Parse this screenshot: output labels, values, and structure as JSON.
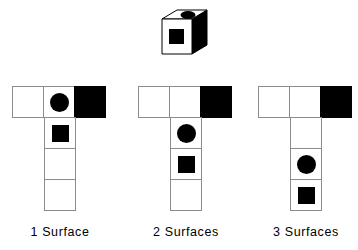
{
  "figure": {
    "background_color": "#ffffff",
    "ink_color": "#000000",
    "grid_line_color": "#8b8b8b"
  },
  "cube": {
    "name": "reference-cube",
    "description": "isometric cube",
    "faces": {
      "top": {
        "fill": "white",
        "mark": "ellipse",
        "mark_color": "#000000"
      },
      "front": {
        "fill": "white",
        "mark": "square",
        "mark_color": "#000000"
      },
      "right": {
        "fill": "black",
        "mark": "none",
        "mark_color": "#000000"
      }
    }
  },
  "nets": [
    {
      "id": "net-1",
      "caption": "1 Surface",
      "top_row": [
        {
          "fill": "white",
          "mark": "none"
        },
        {
          "fill": "white",
          "mark": "circle"
        },
        {
          "fill": "black",
          "mark": "none"
        }
      ],
      "column": [
        {
          "fill": "white",
          "mark": "square"
        },
        {
          "fill": "white",
          "mark": "none"
        },
        {
          "fill": "white",
          "mark": "none"
        }
      ]
    },
    {
      "id": "net-2",
      "caption": "2 Surfaces",
      "top_row": [
        {
          "fill": "white",
          "mark": "none"
        },
        {
          "fill": "white",
          "mark": "none"
        },
        {
          "fill": "black",
          "mark": "none"
        }
      ],
      "column": [
        {
          "fill": "white",
          "mark": "circle"
        },
        {
          "fill": "white",
          "mark": "square"
        },
        {
          "fill": "white",
          "mark": "none"
        }
      ]
    },
    {
      "id": "net-3",
      "caption": "3 Surfaces",
      "top_row": [
        {
          "fill": "white",
          "mark": "none"
        },
        {
          "fill": "white",
          "mark": "none"
        },
        {
          "fill": "black",
          "mark": "none"
        }
      ],
      "column": [
        {
          "fill": "white",
          "mark": "none"
        },
        {
          "fill": "white",
          "mark": "circle"
        },
        {
          "fill": "white",
          "mark": "square"
        }
      ]
    }
  ]
}
